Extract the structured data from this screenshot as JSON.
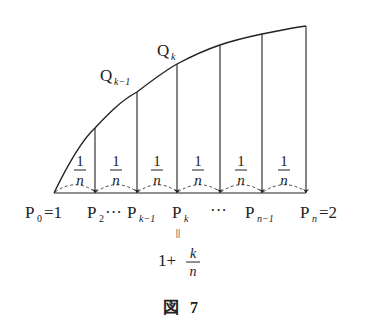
{
  "figure": {
    "caption": "図 7",
    "caption_parts": {
      "kanji": "図",
      "number": "7"
    }
  },
  "curve_labels": {
    "q_k_minus_1": {
      "base": "Q",
      "sub": "k−1"
    },
    "q_k": {
      "base": "Q",
      "sub": "k"
    }
  },
  "segments": {
    "width_label": {
      "numerator": "1",
      "denominator": "n"
    },
    "count_shown": 6
  },
  "points": [
    {
      "base": "P",
      "sub": "0",
      "suffix": "=1"
    },
    {
      "base": "P",
      "sub": "2",
      "suffix": "···"
    },
    {
      "base": "P",
      "sub": "k−1",
      "suffix": ""
    },
    {
      "base": "P",
      "sub": "k",
      "suffix": ""
    },
    {
      "ellipsis": "···"
    },
    {
      "base": "P",
      "sub": "n−1",
      "suffix": ""
    },
    {
      "base": "P",
      "sub": "n",
      "suffix": "=2"
    }
  ],
  "pk_value": {
    "equals_sign": "||",
    "whole": "1+",
    "numerator": "k",
    "denominator": "n"
  },
  "colors": {
    "ink": "#222222",
    "background": "#ffffff"
  }
}
